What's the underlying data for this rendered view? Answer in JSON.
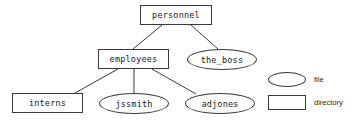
{
  "diagram": {
    "type": "filesystem-tree",
    "background_color": "#ffffff",
    "stroke_color": "#3a3a3a",
    "text_color": "#1a1a1a",
    "nodes": [
      {
        "id": "personnel",
        "label": "personnel",
        "shape": "rectangle",
        "kind": "directory",
        "x": 140,
        "y": 5,
        "w": 72,
        "h": 20
      },
      {
        "id": "employees",
        "label": "employees",
        "shape": "rectangle",
        "kind": "directory",
        "x": 98,
        "y": 49,
        "w": 71,
        "h": 20
      },
      {
        "id": "the_boss",
        "label": "the_boss",
        "shape": "ellipse",
        "kind": "file",
        "x": 187,
        "y": 49,
        "w": 70,
        "h": 21
      },
      {
        "id": "interns",
        "label": "interns",
        "shape": "rectangle",
        "kind": "directory",
        "x": 12,
        "y": 93,
        "w": 71,
        "h": 20
      },
      {
        "id": "jssmith",
        "label": "jssmith",
        "shape": "ellipse",
        "kind": "file",
        "x": 99,
        "y": 93,
        "w": 70,
        "h": 21
      },
      {
        "id": "adjones",
        "label": "adjones",
        "shape": "ellipse",
        "kind": "file",
        "x": 185,
        "y": 93,
        "w": 70,
        "h": 21
      }
    ],
    "edges": [
      {
        "from": "personnel",
        "to": "employees",
        "x1": 162,
        "y1": 25,
        "x2": 133,
        "y2": 49
      },
      {
        "from": "personnel",
        "to": "the_boss",
        "x1": 191,
        "y1": 25,
        "x2": 218,
        "y2": 49
      },
      {
        "from": "employees",
        "to": "interns",
        "x1": 118,
        "y1": 69,
        "x2": 75,
        "y2": 93
      },
      {
        "from": "employees",
        "to": "jssmith",
        "x1": 134,
        "y1": 69,
        "x2": 134,
        "y2": 96
      },
      {
        "from": "employees",
        "to": "adjones",
        "x1": 152,
        "y1": 69,
        "x2": 196,
        "y2": 94
      }
    ]
  },
  "legend": {
    "items": [
      {
        "label": "file",
        "shape": "ellipse",
        "shape_x": 268,
        "shape_y": 72,
        "shape_w": 38,
        "shape_h": 15,
        "label_x": 314,
        "label_y": 76
      },
      {
        "label": "directory",
        "shape": "rectangle",
        "shape_x": 268,
        "shape_y": 95,
        "shape_w": 38,
        "shape_h": 15,
        "label_x": 314,
        "label_y": 99
      }
    ]
  }
}
